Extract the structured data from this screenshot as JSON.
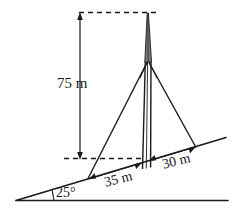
{
  "figure": {
    "labels": {
      "height": "75 m",
      "base_left": "35 m",
      "base_right": "30 m",
      "slope_angle": "25°"
    },
    "values": {
      "tower_height_m": 75,
      "left_anchor_distance_m": 35,
      "right_anchor_distance_m": 30,
      "incline_angle_deg": 25
    },
    "colors": {
      "ink": "#1a1a1a",
      "background": "#ffffff",
      "mast_fill": "#6b6b6b"
    }
  }
}
